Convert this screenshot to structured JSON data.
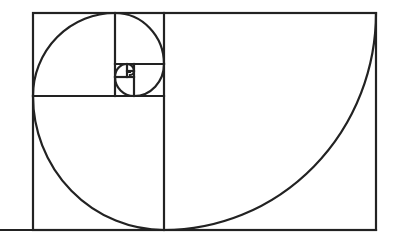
{
  "diagram": {
    "stroke_color": "#222222",
    "background": "#ffffff",
    "squares": [
      {
        "label": "square-1",
        "x": 164,
        "y": 13,
        "w": 212,
        "h": 217
      },
      {
        "label": "square-2",
        "x": 33,
        "y": 96,
        "w": 131,
        "h": 134
      },
      {
        "label": "square-3",
        "x": 33,
        "y": 13,
        "w": 82,
        "h": 83
      },
      {
        "label": "square-4",
        "x": 115,
        "y": 13,
        "w": 49,
        "h": 51
      },
      {
        "label": "square-5",
        "x": 134,
        "y": 64,
        "w": 30,
        "h": 32
      },
      {
        "label": "square-6",
        "x": 115,
        "y": 77,
        "w": 19,
        "h": 19
      },
      {
        "label": "square-7",
        "x": 115,
        "y": 64,
        "w": 12,
        "h": 13
      },
      {
        "label": "square-8",
        "x": 127,
        "y": 64,
        "w": 7,
        "h": 7
      }
    ],
    "baseline": {
      "x1": 0,
      "x2": 376,
      "y": 230
    }
  }
}
